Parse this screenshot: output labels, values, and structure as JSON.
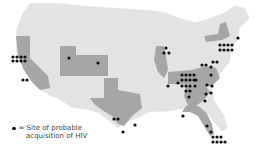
{
  "legend": {
    "symbol": "dot",
    "line1": "= Site of probable",
    "line2": "acquisition of HIV"
  },
  "colors": {
    "background": "#ffffff",
    "state_default": "#e3e3e3",
    "state_highlight": "#a6a6a6",
    "state_border": "#ffffff",
    "dot": "#111111"
  },
  "highlighted_states": [
    "California",
    "Utah",
    "Colorado",
    "Texas",
    "Illinois",
    "New York",
    "Virginia",
    "North Carolina",
    "South Carolina",
    "Georgia",
    "Florida",
    "Tennessee"
  ],
  "sites": [
    {
      "region": "San Francisco, CA",
      "count": 8
    },
    {
      "region": "Southern California",
      "count": 2
    },
    {
      "region": "Utah",
      "count": 1
    },
    {
      "region": "Colorado",
      "count": 1
    },
    {
      "region": "Chicago, IL",
      "count": 3
    },
    {
      "region": "Massachusetts",
      "count": 1
    },
    {
      "region": "New York City area",
      "count": 8
    },
    {
      "region": "Virginia / D.C. area",
      "count": 3
    },
    {
      "region": "Texas",
      "count": 4
    },
    {
      "region": "Southeast (TN/NC/SC/GA)",
      "count": 26
    },
    {
      "region": "Florida",
      "count": 10
    }
  ]
}
